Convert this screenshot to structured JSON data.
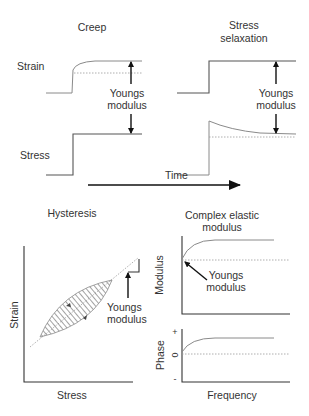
{
  "panels": {
    "creep": {
      "title": "Creep",
      "strain_label": "Strain",
      "stress_label": "Stress",
      "annotation_line1": "Youngs",
      "annotation_line2": "modulus"
    },
    "stress_relaxation": {
      "title_line1": "Stress",
      "title_line2": "selaxation",
      "annotation_line1": "Youngs",
      "annotation_line2": "modulus"
    },
    "time_axis": {
      "label": "Time"
    },
    "hysteresis": {
      "title": "Hysteresis",
      "x_label": "Stress",
      "y_label": "Strain",
      "annotation_line1": "Youngs",
      "annotation_line2": "modulus"
    },
    "complex_modulus": {
      "title_line1": "Complex elastic",
      "title_line2": "modulus",
      "modulus_axis_label": "Modulus",
      "phase_axis_label": "Phase",
      "phase_plus": "+",
      "phase_zero": "0",
      "phase_minus": "-",
      "x_label": "Frequency",
      "annotation_line1": "Youngs",
      "annotation_line2": "modulus"
    }
  },
  "colors": {
    "line": "#555555",
    "curve": "#8a8a8a",
    "arrow": "#111111",
    "text": "#333333"
  }
}
